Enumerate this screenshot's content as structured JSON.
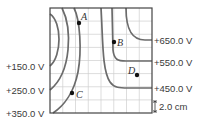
{
  "diagram": {
    "grid": {
      "columns": 8,
      "rows": 8,
      "scale_label": "2.0 cm"
    },
    "left_labels": [
      "+150.0 V",
      "+250.0 V",
      "+350.0 V"
    ],
    "right_labels": [
      "+650.0 V",
      "+550.0 V",
      "+450.0 V"
    ],
    "points": [
      {
        "name": "A"
      },
      {
        "name": "B"
      },
      {
        "name": "C"
      },
      {
        "name": "D"
      }
    ],
    "colors": {
      "lines": "#6b6b6b",
      "grid": "#cfcfcf",
      "frame": "#444444",
      "points": "#111111"
    }
  }
}
